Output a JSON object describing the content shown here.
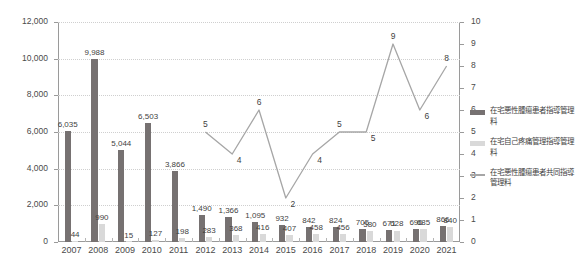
{
  "chart_data": {
    "type": "bar",
    "title": "",
    "subtitle": "",
    "xlabel": "",
    "ylabel": "",
    "categories": [
      "2007",
      "2008",
      "2009",
      "2010",
      "2011",
      "2012",
      "2013",
      "2014",
      "2015",
      "2016",
      "2017",
      "2018",
      "2019",
      "2020",
      "2021"
    ],
    "ylim": [
      0,
      12000
    ],
    "y_ticks": [
      "0",
      "2,000",
      "4,000",
      "6,000",
      "8,000",
      "10,000",
      "12,000"
    ],
    "y2lim": [
      0,
      10
    ],
    "y2_ticks": [
      "0",
      "1",
      "2",
      "3",
      "4",
      "5",
      "6",
      "7",
      "8",
      "9",
      "10"
    ],
    "grid": true,
    "legend_position": "right",
    "series": [
      {
        "name": "在宅悪性腫瘍患者指導管理料",
        "type": "bar",
        "axis": "left",
        "color": "#767171",
        "values": [
          6035,
          9988,
          5044,
          6503,
          3866,
          1490,
          1366,
          1095,
          932,
          842,
          824,
          705,
          671,
          696,
          866
        ],
        "labels": [
          "6,035",
          "9,988",
          "5,044",
          "6,503",
          "3,866",
          "1,490",
          "1,366",
          "1,095",
          "932",
          "842",
          "824",
          "705",
          "671",
          "696",
          "866"
        ]
      },
      {
        "name": "在宅自己疼痛管理指導管理料",
        "type": "bar",
        "axis": "left",
        "color": "#d9d9d9",
        "values": [
          44,
          990,
          15,
          127,
          198,
          283,
          368,
          416,
          407,
          458,
          456,
          580,
          628,
          685,
          840
        ],
        "labels": [
          "44",
          "990",
          "15",
          "127",
          "198",
          "283",
          "368",
          "416",
          "407",
          "458",
          "456",
          "580",
          "628",
          "685",
          "840"
        ]
      },
      {
        "name": "在宅悪性腫瘍患者共同指導管理料",
        "type": "line",
        "axis": "right",
        "color": "#a6a6a6",
        "values": [
          null,
          null,
          null,
          null,
          null,
          5,
          4,
          6,
          2,
          4,
          5,
          5,
          9,
          6,
          8
        ],
        "labels": [
          "",
          "",
          "",
          "",
          "",
          "5",
          "4",
          "6",
          "2",
          "4",
          "5",
          "5",
          "9",
          "6",
          "8"
        ]
      }
    ]
  },
  "legend": {
    "items": [
      {
        "label": "在宅悪性腫瘍患者指導管理料",
        "color": "#767171",
        "marker": "bar"
      },
      {
        "label": "在宅自己疼痛管理指導管理料",
        "color": "#d9d9d9",
        "marker": "bar"
      },
      {
        "label": "在宅悪性腫瘍患者共同指導管理料",
        "color": "#a6a6a6",
        "marker": "line"
      }
    ]
  }
}
